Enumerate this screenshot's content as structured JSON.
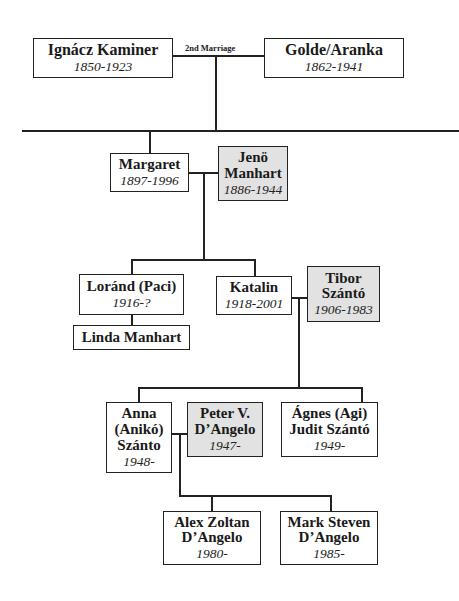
{
  "marriage_label": "2nd Marriage",
  "colors": {
    "line": "#222222",
    "box_fill": "#ffffff",
    "spouse_fill": "#e2e2e2"
  },
  "people": {
    "ignacz": {
      "name": "Ignácz Kaminer",
      "dates": "1850-1923",
      "married_in": false
    },
    "golde": {
      "name": "Golde/Aranka",
      "dates": "1862-1941",
      "married_in": false
    },
    "margaret": {
      "name": "Margaret",
      "dates": "1897-1996",
      "married_in": false
    },
    "jeno": {
      "name_line1": "Jenö",
      "name_line2": "Manhart",
      "dates": "1886-1944",
      "married_in": true
    },
    "lorand": {
      "name": "Loránd (Paci)",
      "dates": "1916-?",
      "married_in": false
    },
    "linda": {
      "name": "Linda Manhart",
      "married_in": false
    },
    "katalin": {
      "name": "Katalin",
      "dates": "1918-2001",
      "married_in": false
    },
    "tibor": {
      "name_line1": "Tibor",
      "name_line2": "Szántó",
      "dates": "1906-1983",
      "married_in": true
    },
    "anna": {
      "name_line1": "Anna",
      "name_line2": "(Anikó)",
      "name_line3": "Szánto",
      "dates": "1948-",
      "married_in": false
    },
    "peter": {
      "name_line1": "Peter V.",
      "name_line2": "D’Angelo",
      "dates": "1947-",
      "married_in": true
    },
    "agnes": {
      "name_line1": "Ágnes (Agi)",
      "name_line2": "Judit Szántó",
      "dates": "1949-",
      "married_in": false
    },
    "alex": {
      "name_line1": "Alex Zoltan",
      "name_line2": "D’Angelo",
      "dates": "1980-",
      "married_in": false
    },
    "mark": {
      "name_line1": "Mark Steven",
      "name_line2": "D’Angelo",
      "dates": "1985-",
      "married_in": false
    }
  }
}
